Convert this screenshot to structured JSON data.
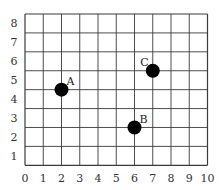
{
  "chart_data": {
    "type": "scatter",
    "title": "",
    "xlabel": "",
    "ylabel": "",
    "xlim": [
      0,
      10
    ],
    "ylim": [
      0,
      8
    ],
    "grid": true,
    "x_ticks": [
      "0",
      "1",
      "2",
      "3",
      "4",
      "5",
      "6",
      "7",
      "8",
      "9",
      "10"
    ],
    "y_ticks": [
      "1",
      "2",
      "3",
      "4",
      "5",
      "6",
      "7",
      "8"
    ],
    "points": [
      {
        "label": "A",
        "x": 2,
        "y": 4
      },
      {
        "label": "B",
        "x": 6,
        "y": 2
      },
      {
        "label": "C",
        "x": 7,
        "y": 5
      }
    ],
    "colors": {
      "grid": "#3a3a3a",
      "point": "#000000",
      "text": "#333333"
    }
  }
}
